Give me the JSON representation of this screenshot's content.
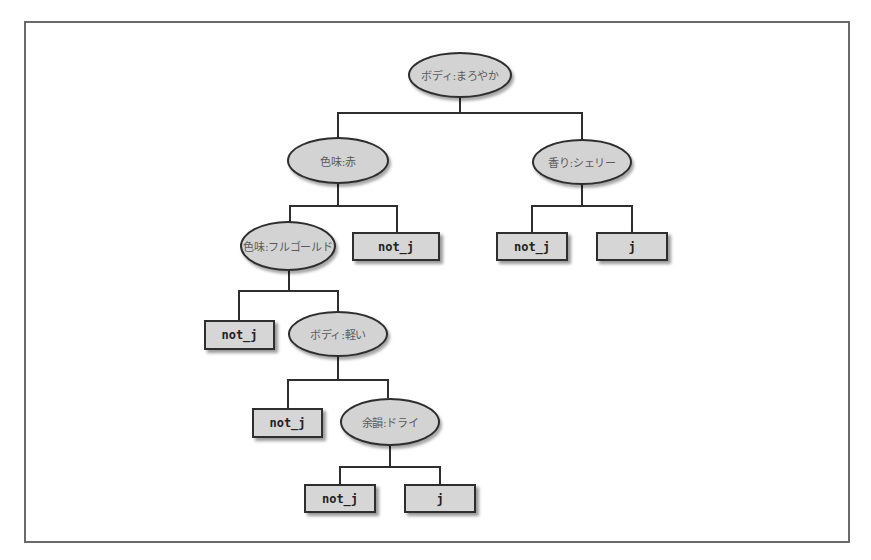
{
  "diagram": {
    "type": "decision-tree",
    "colors": {
      "node_fill": "#d3d3d3",
      "border": "#2e2e2e",
      "frame": "#6a6a6a",
      "background": "#ffffff"
    },
    "nodes": {
      "root": {
        "label": "ボディ:まろやか"
      },
      "color_red": {
        "label": "色味:赤"
      },
      "aroma_sherry": {
        "label": "香り:シェリー"
      },
      "color_fullgold": {
        "label": "色味:フルゴールド"
      },
      "leaf_red_no": {
        "label": "not_j"
      },
      "leaf_sherry_no": {
        "label": "not_j"
      },
      "leaf_sherry_yes": {
        "label": "j"
      },
      "leaf_fullgold_no": {
        "label": "not_j"
      },
      "body_light": {
        "label": "ボディ:軽い"
      },
      "leaf_light_no": {
        "label": "not_j"
      },
      "finish_dry": {
        "label": "余韻:ドライ"
      },
      "leaf_dry_no": {
        "label": "not_j"
      },
      "leaf_dry_yes": {
        "label": "j"
      }
    },
    "edges": [
      [
        "root",
        "color_red"
      ],
      [
        "root",
        "aroma_sherry"
      ],
      [
        "color_red",
        "color_fullgold"
      ],
      [
        "color_red",
        "leaf_red_no"
      ],
      [
        "aroma_sherry",
        "leaf_sherry_no"
      ],
      [
        "aroma_sherry",
        "leaf_sherry_yes"
      ],
      [
        "color_fullgold",
        "leaf_fullgold_no"
      ],
      [
        "color_fullgold",
        "body_light"
      ],
      [
        "body_light",
        "leaf_light_no"
      ],
      [
        "body_light",
        "finish_dry"
      ],
      [
        "finish_dry",
        "leaf_dry_no"
      ],
      [
        "finish_dry",
        "leaf_dry_yes"
      ]
    ]
  }
}
